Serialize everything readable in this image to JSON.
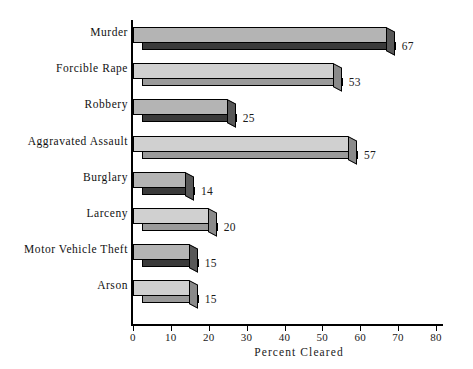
{
  "chart_data": {
    "type": "bar",
    "orientation": "horizontal",
    "title": "",
    "xlabel": "Percent Cleared",
    "ylabel": "",
    "xlim": [
      0,
      80
    ],
    "xticks": [
      0,
      10,
      20,
      30,
      40,
      50,
      60,
      70,
      80
    ],
    "xtick_labels": [
      "0",
      "10",
      "20",
      "30",
      "40",
      "50",
      "60",
      "70",
      "80"
    ],
    "grid": false,
    "legend": false,
    "style": "3d-horizontal-bars",
    "categories": [
      "Murder",
      "Forcible Rape",
      "Robbery",
      "Aggravated Assault",
      "Burglary",
      "Larceny",
      "Motor Vehicle Theft",
      "Arson"
    ],
    "values": [
      67,
      53,
      25,
      57,
      14,
      20,
      15,
      15
    ],
    "value_labels": [
      "67",
      "53",
      "25",
      "57",
      "14",
      "20",
      "15",
      "15"
    ],
    "bar_shades": [
      "dark",
      "light",
      "dark",
      "light",
      "dark",
      "light",
      "dark",
      "light"
    ],
    "colors": {
      "bar_top_dark": "#b4b4b4",
      "bar_front_dark": "#3a3a3a",
      "bar_side_dark": "#585858",
      "bar_top_light": "#d0d0d0",
      "bar_front_light": "#9a9a9a",
      "bar_side_light": "#8a8a8a",
      "axis": "#000000",
      "text": "#1a1a1a",
      "background": "#ffffff"
    }
  }
}
